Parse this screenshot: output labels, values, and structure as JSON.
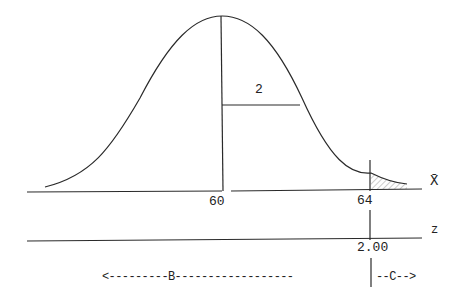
{
  "diagram": {
    "type": "normal-distribution-sampling",
    "mean_label": "60",
    "value_label": "64",
    "std_error_label": "2",
    "xbar_axis_label": "X̄",
    "z_axis_label": "z",
    "z_value_label": "2.00",
    "region_b_label": "<---------B------------------",
    "region_c_label": "--C-->",
    "colors": {
      "line": "#2a2a2a",
      "shade": "#9a9a9a",
      "background": "#ffffff"
    }
  }
}
